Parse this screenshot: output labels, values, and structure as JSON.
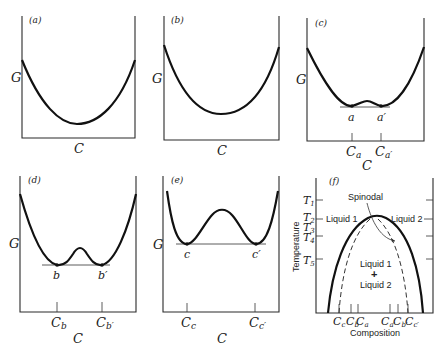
{
  "figure": {
    "panels": [
      {
        "id": "a",
        "label": "(a)",
        "y_axis": "G",
        "x_axis": "C"
      },
      {
        "id": "b",
        "label": "(b)",
        "y_axis": "G",
        "x_axis": "C"
      },
      {
        "id": "c",
        "label": "(c)",
        "y_axis": "G",
        "x_axis": "C",
        "points": [
          "a",
          "a′"
        ],
        "ticks": [
          "C",
          "C"
        ],
        "tick_subs": [
          "a",
          "a′"
        ]
      },
      {
        "id": "d",
        "label": "(d)",
        "y_axis": "G",
        "x_axis": "C",
        "points": [
          "b",
          "b′"
        ],
        "ticks": [
          "C",
          "C"
        ],
        "tick_subs": [
          "b",
          "b′"
        ]
      },
      {
        "id": "e",
        "label": "(e)",
        "y_axis": "G",
        "x_axis": "C",
        "points": [
          "c",
          "c′"
        ],
        "ticks": [
          "C",
          "C"
        ],
        "tick_subs": [
          "c",
          "c′"
        ]
      },
      {
        "id": "f",
        "label": "(f)",
        "y_axis": "Temperature",
        "x_axis": "Composition",
        "temps": [
          "T",
          "T",
          "T",
          "T",
          "T"
        ],
        "temp_subs": [
          "1",
          "2",
          "3",
          "4",
          "5"
        ],
        "annotations": {
          "spinodal": "Spinodal",
          "liquid1": "Liquid 1",
          "liquid2": "Liquid 2",
          "region_top": "Liquid 1",
          "plus": "+",
          "region_bottom": "Liquid 2"
        },
        "comp_ticks": [
          "C",
          "C",
          "C",
          "C",
          "C",
          "C"
        ],
        "comp_subs": [
          "c",
          "b",
          "a",
          "a′",
          "b′",
          "c′"
        ]
      }
    ]
  }
}
